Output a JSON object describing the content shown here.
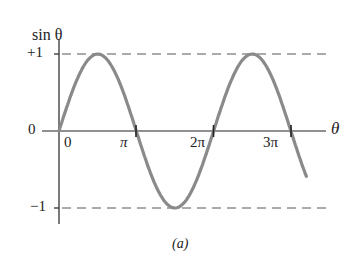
{
  "chart_data": {
    "type": "line",
    "title": "",
    "ylabel": "sin θ",
    "xlabel": "θ",
    "caption": "(a)",
    "x_ticks": [
      "0",
      "π",
      "2π",
      "3π"
    ],
    "y_ticks": [
      "+1",
      "0",
      "−1"
    ],
    "ylim": [
      -1,
      1
    ],
    "xlim": [
      0,
      3.3
    ],
    "x_units": "π radians",
    "grid": false,
    "reference_lines": [
      {
        "y": 1,
        "style": "dashed"
      },
      {
        "y": -1,
        "style": "dashed"
      }
    ],
    "series": [
      {
        "name": "sin θ",
        "color": "#8a8a8a",
        "x": [
          0,
          0.25,
          0.5,
          0.75,
          1,
          1.25,
          1.5,
          1.75,
          2,
          2.25,
          2.5,
          2.75,
          3,
          3.2
        ],
        "values": [
          0,
          0.707,
          1,
          0.707,
          0,
          -0.707,
          -1,
          -0.707,
          0,
          0.707,
          1,
          0.707,
          0,
          -0.588
        ]
      }
    ]
  },
  "labels": {
    "y_axis": "sin θ",
    "x_axis": "θ",
    "y_plus1": "+1",
    "y_zero": "0",
    "y_minus1": "−1",
    "x_0": "0",
    "x_pi": "π",
    "x_2pi": "2π",
    "x_3pi": "3π",
    "caption": "(a)"
  }
}
